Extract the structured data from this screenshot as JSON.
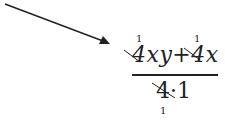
{
  "expression": {
    "numerator": {
      "term1_coef": "4",
      "term1_vars": "xy",
      "operator": "+",
      "term2_coef": "4",
      "term2_vars": "x",
      "cancel_marks": [
        "1",
        "1"
      ]
    },
    "denominator": {
      "text_left": "4",
      "dot": "·",
      "text_right": "1",
      "cancel_mark": "1"
    }
  },
  "colors": {
    "ink": "#222222",
    "background": "#ffffff"
  }
}
